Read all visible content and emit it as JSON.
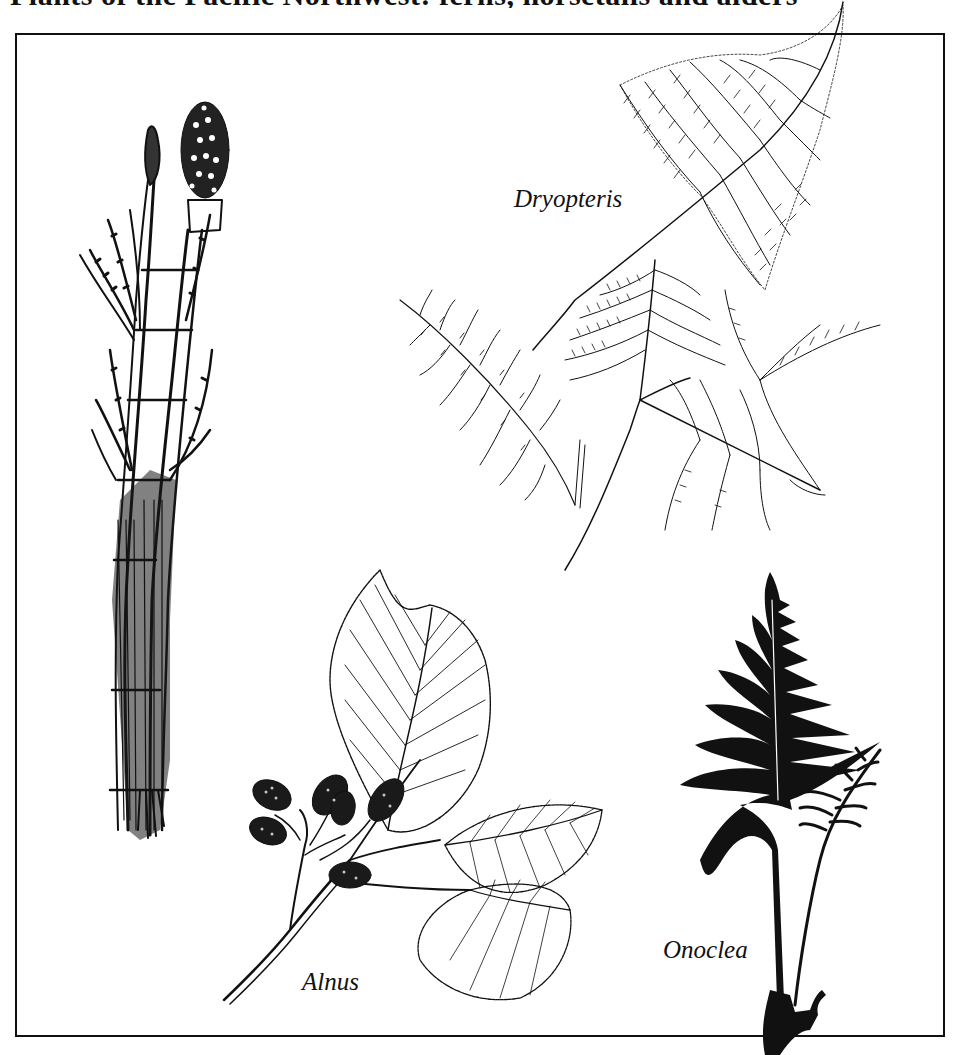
{
  "heading": {
    "text": "Plants of the Pacific Northwest: ferns, horsetails and alders",
    "clipped": true
  },
  "plate": {
    "border_color": "#111111",
    "background": "#ffffff",
    "specimens": [
      {
        "id": "horsetail",
        "label": "",
        "description": "Equisetum stems with strobili and whorled branches"
      },
      {
        "id": "dryopteris",
        "label": "Dryopteris",
        "description": "Two finely divided fern fronds"
      },
      {
        "id": "alnus",
        "label": "Alnus",
        "description": "Alder twig with serrated leaves and woody cones"
      },
      {
        "id": "onoclea",
        "label": "Onoclea",
        "description": "Dark silhouette fern with sterile and fertile fronds"
      }
    ]
  },
  "labels": {
    "dryopteris": "Dryopteris",
    "alnus": "Alnus",
    "onoclea": "Onoclea"
  },
  "colors": {
    "ink": "#111111",
    "paper": "#ffffff"
  }
}
